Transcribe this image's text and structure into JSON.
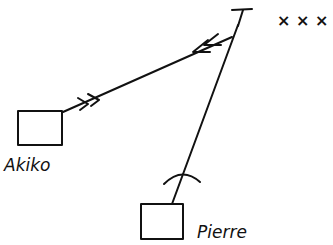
{
  "diagram": {
    "nodes": {
      "target": {
        "label": "T",
        "marks": "× × ×"
      },
      "akiko": {
        "label": "Akiko"
      },
      "pierre": {
        "label": "Pierre"
      }
    },
    "edges": [
      {
        "from": "akiko",
        "to": "target",
        "style": "double-arrow-toward-target"
      },
      {
        "from": "target",
        "to": "akiko",
        "style": "double-arrow-toward-akiko"
      },
      {
        "from": "target",
        "to": "pierre",
        "style": "line-with-arc-block"
      }
    ],
    "colors": {
      "ink": "#111111",
      "background": "#ffffff"
    }
  }
}
